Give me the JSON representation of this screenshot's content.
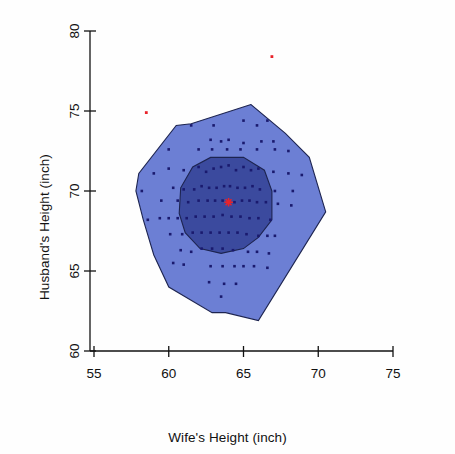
{
  "chart_data": {
    "type": "scatter",
    "title": "",
    "subtitle": "",
    "xlabel": "Wife's Height (inch)",
    "ylabel": "Husband's Height (inch)",
    "xlim": [
      55,
      75
    ],
    "ylim": [
      60,
      80
    ],
    "xticks": [
      55,
      60,
      65,
      70,
      75
    ],
    "yticks": [
      60,
      65,
      70,
      75,
      80
    ],
    "xtick_labels": [
      "55",
      "60",
      "65",
      "70",
      "75"
    ],
    "ytick_labels": [
      "60",
      "65",
      "70",
      "75",
      "80"
    ],
    "grid": false,
    "legend": "none",
    "plot_kind": "bagplot",
    "colors": {
      "fence_fill": "#6c7fd4",
      "bag_fill": "#3b4a9e",
      "hull_stroke": "#1d2450",
      "point": "#1a1a6e",
      "outlier": "#e8232a",
      "median": "#e8232a",
      "axis": "#111111",
      "background": "#ffffff"
    },
    "median": {
      "x": 64.0,
      "y": 69.3,
      "label": "depth median"
    },
    "outliers": [
      {
        "x": 58.5,
        "y": 74.9
      },
      {
        "x": 66.9,
        "y": 78.4
      }
    ],
    "fence_hull": [
      {
        "x": 65.5,
        "y": 75.4
      },
      {
        "x": 61.5,
        "y": 74.2
      },
      {
        "x": 60.5,
        "y": 74.1
      },
      {
        "x": 58.0,
        "y": 71.1
      },
      {
        "x": 57.8,
        "y": 70.0
      },
      {
        "x": 58.3,
        "y": 68.2
      },
      {
        "x": 59.0,
        "y": 66.0
      },
      {
        "x": 60.0,
        "y": 64.0
      },
      {
        "x": 62.9,
        "y": 62.4
      },
      {
        "x": 63.8,
        "y": 62.4
      },
      {
        "x": 66.0,
        "y": 61.9
      },
      {
        "x": 70.5,
        "y": 68.7
      },
      {
        "x": 69.4,
        "y": 72.1
      },
      {
        "x": 67.8,
        "y": 73.6
      }
    ],
    "bag_hull": [
      {
        "x": 62.8,
        "y": 72.1
      },
      {
        "x": 65.0,
        "y": 72.1
      },
      {
        "x": 66.4,
        "y": 71.3
      },
      {
        "x": 66.9,
        "y": 70.0
      },
      {
        "x": 66.9,
        "y": 68.2
      },
      {
        "x": 66.0,
        "y": 67.1
      },
      {
        "x": 65.0,
        "y": 66.4
      },
      {
        "x": 63.5,
        "y": 66.1
      },
      {
        "x": 62.1,
        "y": 66.4
      },
      {
        "x": 61.1,
        "y": 67.4
      },
      {
        "x": 60.7,
        "y": 68.6
      },
      {
        "x": 60.8,
        "y": 70.2
      },
      {
        "x": 61.6,
        "y": 71.5
      }
    ],
    "points": [
      {
        "x": 61.5,
        "y": 74.1
      },
      {
        "x": 63.0,
        "y": 74.1
      },
      {
        "x": 65.0,
        "y": 74.4
      },
      {
        "x": 65.9,
        "y": 74.1
      },
      {
        "x": 66.6,
        "y": 74.4
      },
      {
        "x": 62.8,
        "y": 73.2
      },
      {
        "x": 64.0,
        "y": 73.2
      },
      {
        "x": 65.0,
        "y": 73.0
      },
      {
        "x": 66.2,
        "y": 73.1
      },
      {
        "x": 67.0,
        "y": 73.1
      },
      {
        "x": 60.0,
        "y": 72.6
      },
      {
        "x": 62.0,
        "y": 72.6
      },
      {
        "x": 62.9,
        "y": 72.6
      },
      {
        "x": 63.5,
        "y": 73.1
      },
      {
        "x": 63.9,
        "y": 72.6
      },
      {
        "x": 64.8,
        "y": 72.6
      },
      {
        "x": 65.9,
        "y": 72.6
      },
      {
        "x": 67.1,
        "y": 72.6
      },
      {
        "x": 68.0,
        "y": 72.5
      },
      {
        "x": 59.0,
        "y": 71.1
      },
      {
        "x": 60.0,
        "y": 71.4
      },
      {
        "x": 61.0,
        "y": 71.3
      },
      {
        "x": 62.0,
        "y": 71.5
      },
      {
        "x": 62.5,
        "y": 71.2
      },
      {
        "x": 63.0,
        "y": 71.4
      },
      {
        "x": 63.5,
        "y": 71.5
      },
      {
        "x": 64.0,
        "y": 71.6
      },
      {
        "x": 64.5,
        "y": 71.3
      },
      {
        "x": 65.0,
        "y": 71.5
      },
      {
        "x": 65.5,
        "y": 71.3
      },
      {
        "x": 66.0,
        "y": 71.4
      },
      {
        "x": 67.0,
        "y": 71.2
      },
      {
        "x": 68.0,
        "y": 71.1
      },
      {
        "x": 68.9,
        "y": 71.0
      },
      {
        "x": 58.2,
        "y": 70.0
      },
      {
        "x": 60.3,
        "y": 70.2
      },
      {
        "x": 61.0,
        "y": 70.1
      },
      {
        "x": 61.7,
        "y": 70.1
      },
      {
        "x": 62.2,
        "y": 70.3
      },
      {
        "x": 62.7,
        "y": 70.2
      },
      {
        "x": 63.2,
        "y": 70.2
      },
      {
        "x": 63.7,
        "y": 70.3
      },
      {
        "x": 64.1,
        "y": 70.3
      },
      {
        "x": 64.6,
        "y": 70.2
      },
      {
        "x": 65.1,
        "y": 70.2
      },
      {
        "x": 65.6,
        "y": 70.3
      },
      {
        "x": 66.1,
        "y": 70.1
      },
      {
        "x": 67.1,
        "y": 70.0
      },
      {
        "x": 68.3,
        "y": 70.0
      },
      {
        "x": 59.5,
        "y": 69.4
      },
      {
        "x": 60.6,
        "y": 69.4
      },
      {
        "x": 61.3,
        "y": 69.3
      },
      {
        "x": 62.0,
        "y": 69.4
      },
      {
        "x": 62.6,
        "y": 69.4
      },
      {
        "x": 63.1,
        "y": 69.4
      },
      {
        "x": 63.6,
        "y": 69.4
      },
      {
        "x": 64.4,
        "y": 69.3
      },
      {
        "x": 64.9,
        "y": 69.4
      },
      {
        "x": 65.4,
        "y": 69.4
      },
      {
        "x": 65.9,
        "y": 69.3
      },
      {
        "x": 66.5,
        "y": 69.3
      },
      {
        "x": 67.3,
        "y": 69.2
      },
      {
        "x": 68.2,
        "y": 69.1
      },
      {
        "x": 58.6,
        "y": 68.2
      },
      {
        "x": 59.4,
        "y": 68.3
      },
      {
        "x": 60.0,
        "y": 68.3
      },
      {
        "x": 60.6,
        "y": 68.3
      },
      {
        "x": 61.2,
        "y": 68.3
      },
      {
        "x": 61.8,
        "y": 68.4
      },
      {
        "x": 62.4,
        "y": 68.4
      },
      {
        "x": 63.0,
        "y": 68.4
      },
      {
        "x": 63.6,
        "y": 68.5
      },
      {
        "x": 64.2,
        "y": 68.4
      },
      {
        "x": 64.8,
        "y": 68.4
      },
      {
        "x": 65.4,
        "y": 68.3
      },
      {
        "x": 66.0,
        "y": 68.3
      },
      {
        "x": 66.8,
        "y": 68.2
      },
      {
        "x": 60.1,
        "y": 67.3
      },
      {
        "x": 60.9,
        "y": 67.3
      },
      {
        "x": 61.6,
        "y": 67.4
      },
      {
        "x": 62.2,
        "y": 67.4
      },
      {
        "x": 62.8,
        "y": 67.4
      },
      {
        "x": 63.4,
        "y": 67.4
      },
      {
        "x": 64.0,
        "y": 67.4
      },
      {
        "x": 64.6,
        "y": 67.4
      },
      {
        "x": 65.2,
        "y": 67.3
      },
      {
        "x": 66.0,
        "y": 67.2
      },
      {
        "x": 66.6,
        "y": 67.2
      },
      {
        "x": 67.1,
        "y": 67.2
      },
      {
        "x": 60.8,
        "y": 66.3
      },
      {
        "x": 61.5,
        "y": 66.2
      },
      {
        "x": 62.2,
        "y": 66.4
      },
      {
        "x": 62.9,
        "y": 66.4
      },
      {
        "x": 63.6,
        "y": 66.4
      },
      {
        "x": 64.3,
        "y": 66.3
      },
      {
        "x": 65.3,
        "y": 66.2
      },
      {
        "x": 65.9,
        "y": 66.2
      },
      {
        "x": 66.7,
        "y": 66.1
      },
      {
        "x": 60.3,
        "y": 65.5
      },
      {
        "x": 61.0,
        "y": 65.4
      },
      {
        "x": 62.8,
        "y": 65.3
      },
      {
        "x": 63.6,
        "y": 65.3
      },
      {
        "x": 64.4,
        "y": 65.3
      },
      {
        "x": 65.0,
        "y": 65.3
      },
      {
        "x": 65.7,
        "y": 65.3
      },
      {
        "x": 66.6,
        "y": 65.2
      },
      {
        "x": 62.7,
        "y": 64.3
      },
      {
        "x": 63.7,
        "y": 64.2
      },
      {
        "x": 64.5,
        "y": 64.2
      },
      {
        "x": 63.5,
        "y": 63.4
      }
    ]
  },
  "axes": {
    "x_title": "Wife's Height (inch)",
    "y_title": "Husband's Height (inch)"
  }
}
